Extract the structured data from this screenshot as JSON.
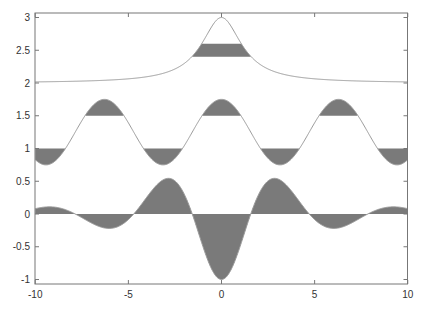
{
  "chart_data": {
    "type": "area",
    "title": "",
    "xlabel": "",
    "ylabel": "",
    "xlim": [
      -10,
      10
    ],
    "ylim": [
      -1.1,
      3.1
    ],
    "grid": false,
    "legend": "none",
    "x_ticks": [
      "-10",
      "-5",
      "0",
      "5",
      "10"
    ],
    "x_tick_values": [
      -10,
      -5,
      0,
      5,
      10
    ],
    "y_ticks": [
      "-1",
      "-0.5",
      "0",
      "0.5",
      "1",
      "1.5",
      "2",
      "2.5",
      "3"
    ],
    "y_tick_values": [
      -1,
      -0.5,
      0,
      0.5,
      1,
      1.5,
      2,
      2.5,
      3
    ],
    "series": [
      {
        "name": "peak",
        "formula": "2 + 1/(1 + x^2/1.7)",
        "x": [
          -10,
          -5,
          -3,
          -2,
          -1.5,
          -1,
          -0.5,
          0,
          0.5,
          1,
          1.5,
          2,
          3,
          5,
          10
        ],
        "values": [
          2.02,
          2.06,
          2.16,
          2.3,
          2.43,
          2.63,
          2.87,
          3.0,
          2.87,
          2.63,
          2.43,
          2.3,
          2.16,
          2.06,
          2.02
        ],
        "fill_band": {
          "low": 2.4,
          "high": 2.6
        }
      },
      {
        "name": "wave",
        "formula": "1.25 + 0.5*cos(x)",
        "x": [
          -10,
          -9.42,
          -6.28,
          -3.14,
          0,
          3.14,
          6.28,
          9.42,
          10
        ],
        "values": [
          0.83,
          0.75,
          1.75,
          0.75,
          1.75,
          0.75,
          1.75,
          0.75,
          0.83
        ],
        "fill_above": 1.5,
        "fill_below": 1.0
      },
      {
        "name": "damped",
        "formula": "-cos(x)/(1 + 0.0935*x^2)",
        "x": [
          -10,
          -9.42,
          -7.85,
          -6.28,
          -4.71,
          -3.14,
          -1.57,
          0,
          1.57,
          3.14,
          4.71,
          6.28,
          7.85,
          9.42,
          10
        ],
        "values": [
          0.08,
          0.11,
          0,
          -0.21,
          0,
          0.52,
          0,
          -1.0,
          0,
          0.52,
          0,
          -0.21,
          0,
          0.11,
          0.08
        ],
        "fill_to": 0
      }
    ],
    "colors": {
      "fill": "#7a7a7a",
      "line": "#9a9a9a",
      "axis": "#777777"
    }
  }
}
